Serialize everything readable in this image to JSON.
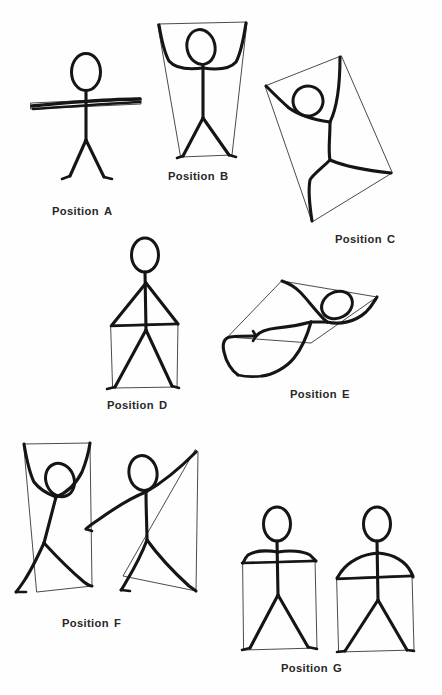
{
  "page": {
    "background_color": "#fefefe",
    "ink_color": "#151515",
    "guide_color": "#2b2b2b",
    "width": 442,
    "height": 695
  },
  "figures": [
    {
      "id": "a",
      "label_word": "Position",
      "label_letter": "A",
      "description": "Stick figure standing upright, arms stretched horizontally out to both sides, legs apart",
      "label_x": 52,
      "label_y": 205,
      "guide_shape": "horizontal-bar",
      "figure_count": 1
    },
    {
      "id": "b",
      "label_word": "Position",
      "label_letter": "B",
      "description": "Stick figure with both arms raised up and outward, legs apart, enclosed in a downward-tapering trapezoid guide",
      "label_x": 168,
      "label_y": 170,
      "guide_shape": "trapezoid",
      "figure_count": 1
    },
    {
      "id": "c",
      "label_word": "Position",
      "label_letter": "C",
      "description": "Stick figure tilted and twisted, one arm up right and one arm out left, enclosed in a rotated quadrilateral guide",
      "label_x": 335,
      "label_y": 233,
      "guide_shape": "rotated-quadrilateral",
      "figure_count": 1
    },
    {
      "id": "d",
      "label_word": "Position",
      "label_letter": "D",
      "description": "Stick figure standing upright, arms angled down to shoulder-width, legs apart, enclosed in a rectangle guide",
      "label_x": 107,
      "label_y": 399,
      "guide_shape": "rectangle",
      "figure_count": 1
    },
    {
      "id": "e",
      "label_word": "Position",
      "label_letter": "E",
      "description": "Stick figure rotated nearly horizontal, limbs splayed, enclosed in a flattened tilted quadrilateral guide",
      "label_x": 290,
      "label_y": 388,
      "guide_shape": "flattened-quadrilateral",
      "figure_count": 1
    },
    {
      "id": "f",
      "label_word": "Position",
      "label_letter": "F",
      "description": "Two stick figures side by side: left one with both arms raised overhead leaning left, right one striding with right arm raised high and left arm extended down-left",
      "label_x": 62,
      "label_y": 617,
      "guide_shape": "paired-quadrilaterals",
      "figure_count": 2
    },
    {
      "id": "g",
      "label_word": "Position",
      "label_letter": "G",
      "description": "Two stick figures standing upright with arms out to the sides at shoulder height, legs apart, each enclosed in a box guide",
      "label_x": 281,
      "label_y": 662,
      "guide_shape": "paired-boxes",
      "figure_count": 2
    }
  ]
}
